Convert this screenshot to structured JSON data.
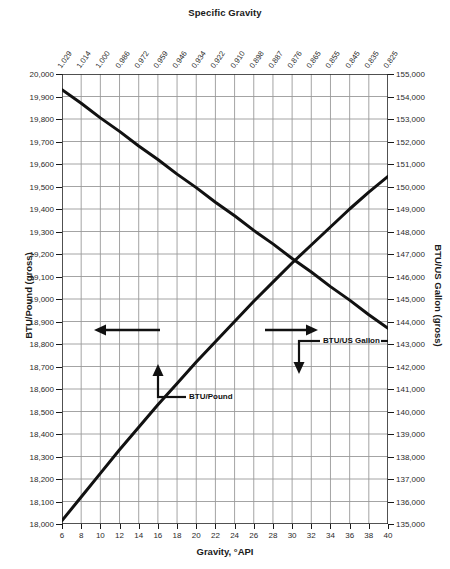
{
  "titles": {
    "top_axis": "Specific Gravity",
    "bottom_axis": "Gravity, °API",
    "left_axis": "BTU/Pound (gross)",
    "right_axis": "BTU/US Gallon (gross)"
  },
  "annotations": {
    "btu_per_pound": "BTU/Pound",
    "btu_per_gallon": "BTU/US Gallon"
  },
  "colors": {
    "curve": "#111111",
    "grid": "#9a9a9a",
    "axis": "#1a1a1a",
    "text": "#1a1a1a",
    "background": "#ffffff"
  },
  "chart_data": {
    "type": "line",
    "title": "Specific Gravity",
    "xlabel": "Gravity, °API",
    "ylabel": "BTU/Pound (gross)",
    "y2label": "BTU/US Gallon (gross)",
    "grid": true,
    "legend": "none (inline arrow callouts)",
    "xlim": [
      6,
      40
    ],
    "ylim": [
      18000,
      20000
    ],
    "y2lim": [
      135000,
      155000
    ],
    "x_ticks": [
      6,
      8,
      10,
      12,
      14,
      16,
      18,
      20,
      22,
      24,
      26,
      28,
      30,
      32,
      34,
      36,
      38,
      40
    ],
    "y_ticks": [
      18000,
      18100,
      18200,
      18300,
      18400,
      18500,
      18600,
      18700,
      18800,
      18900,
      19000,
      19100,
      19200,
      19300,
      19400,
      19500,
      19600,
      19700,
      19800,
      19900,
      20000
    ],
    "y_tick_labels": [
      "18,000",
      "18,100",
      "18,200",
      "18,300",
      "18,400",
      "18,500",
      "18,600",
      "18,700",
      "18,800",
      "18,900",
      "19,000",
      "19,100",
      "19,200",
      "19,300",
      "19,400",
      "19,500",
      "19,600",
      "19,700",
      "19,800",
      "19,900",
      "20,000"
    ],
    "y2_ticks": [
      135000,
      136000,
      137000,
      138000,
      139000,
      140000,
      141000,
      142000,
      143000,
      144000,
      145000,
      146000,
      147000,
      148000,
      149000,
      150000,
      151000,
      152000,
      153000,
      154000,
      155000
    ],
    "y2_tick_labels": [
      "135,000",
      "136,000",
      "137,000",
      "138,000",
      "139,000",
      "140,000",
      "141,000",
      "142,000",
      "143,000",
      "144,000",
      "145,000",
      "146,000",
      "147,000",
      "148,000",
      "149,000",
      "150,000",
      "151,000",
      "152,000",
      "153,000",
      "154,000",
      "155,000"
    ],
    "top_axis_label": "Specific Gravity",
    "top_axis_ticks": [
      6,
      8,
      10,
      12,
      14,
      16,
      18,
      20,
      22,
      24,
      26,
      28,
      30,
      32,
      34,
      36,
      38,
      40
    ],
    "top_axis_tick_labels": [
      "1.029",
      "1.014",
      "1.000",
      "0.986",
      "0.972",
      "0.959",
      "0.946",
      "0.934",
      "0.922",
      "0.910",
      "0.898",
      "0.887",
      "0.876",
      "0.865",
      "0.855",
      "0.845",
      "0.835",
      "0.825"
    ],
    "series": [
      {
        "name": "BTU/Pound",
        "axis": "left",
        "direction": "decreasing",
        "annotation_arrow": "left",
        "x": [
          6,
          8,
          10,
          12,
          14,
          16,
          18,
          20,
          22,
          24,
          26,
          28,
          30,
          32,
          34,
          36,
          38,
          40
        ],
        "values": [
          19930,
          19870,
          19805,
          19745,
          19680,
          19620,
          19555,
          19495,
          19430,
          19370,
          19305,
          19245,
          19180,
          19120,
          19055,
          18995,
          18930,
          18870
        ]
      },
      {
        "name": "BTU/US Gallon",
        "axis": "right",
        "direction": "increasing",
        "annotation_arrow": "right",
        "x": [
          6,
          8,
          10,
          12,
          14,
          16,
          18,
          20,
          22,
          24,
          26,
          28,
          30,
          32,
          34,
          36,
          38,
          40
        ],
        "values": [
          135150,
          136200,
          137250,
          138300,
          139300,
          140300,
          141250,
          142200,
          143100,
          144000,
          144900,
          145750,
          146600,
          147400,
          148200,
          149000,
          149750,
          150450
        ]
      }
    ],
    "crossing_point": {
      "x": 23,
      "left_value": 19020,
      "right_value": 145200
    }
  }
}
